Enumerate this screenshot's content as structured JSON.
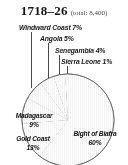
{
  "figure": {
    "title_year": "1718–26",
    "title_total": "(total: 8,400)"
  },
  "callouts": [
    {
      "name": "windward-coast",
      "text": "Windward Coast 7%"
    },
    {
      "name": "angola",
      "text": "Angola  5%"
    },
    {
      "name": "senegambia",
      "text": "Senegambia  4%"
    },
    {
      "name": "sierra-leone",
      "text": "Sierra Leone  1%"
    }
  ],
  "inlabels": {
    "madagascar": "Madagascar\n9%",
    "madagascar_name": "Madagascar",
    "madagascar_pct": "9%",
    "gold_coast_name": "Gold Coast",
    "gold_coast_pct": "13%",
    "biafra_name": "Bight of Biafra",
    "biafra_pct": "60%"
  },
  "colors": {
    "slice_light": "#dcdcdc",
    "slice_mid": "#cfcfcf",
    "slice_dark": "#c2c2c2",
    "slice_pale": "#e8e8e8",
    "outline": "#6b6b6b",
    "leader": "#4d4d4d",
    "text": "#1a1a1a",
    "background": "#ffffff"
  },
  "chart_data": {
    "type": "pie",
    "title": "1718–26",
    "subtitle": "(total: 8,400)",
    "total": 8400,
    "unit": "percent",
    "legend_position": "callouts-and-inline",
    "grid": false,
    "categories": [
      "Bight of Biafra",
      "Gold Coast",
      "Madagascar",
      "Windward Coast",
      "Angola",
      "Senegambia",
      "Sierra Leone"
    ],
    "values": [
      60,
      13,
      9,
      7,
      5,
      4,
      1
    ],
    "labels": [
      "Bight of Biafra 60%",
      "Gold Coast 13%",
      "Madagascar 9%",
      "Windward Coast 7%",
      "Angola 5%",
      "Senegambia 4%",
      "Sierra Leone 1%"
    ],
    "slice_fills": [
      "#d8d8d8",
      "#ececec",
      "#c9c9c9",
      "#d2d2d2",
      "#c2c2c2",
      "#dadada",
      "#cbcbcb"
    ],
    "start_angle_deg": 0,
    "direction": "clockwise",
    "xlabel": "",
    "ylabel": ""
  }
}
